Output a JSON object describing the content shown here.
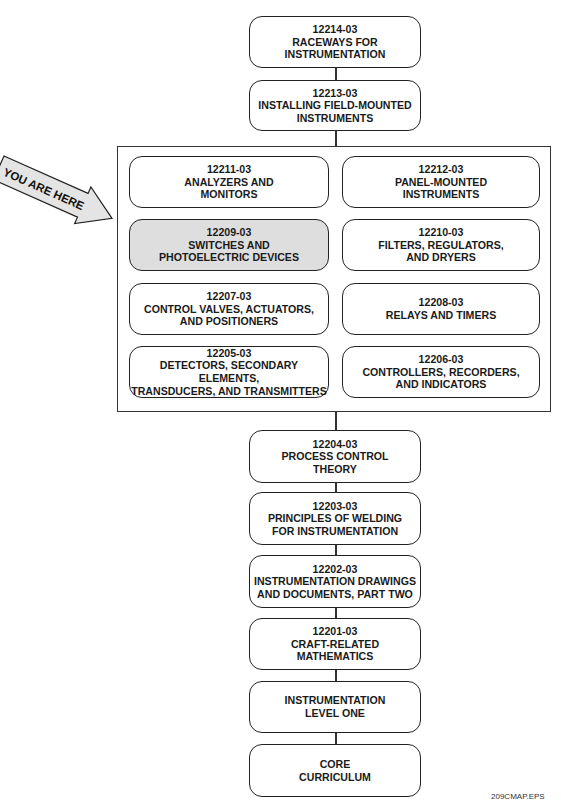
{
  "diagram": {
    "type": "course-map-flow",
    "pointer": {
      "label": "YOU ARE HERE",
      "points_to": "12209-03"
    },
    "top_stack": [
      {
        "code": "12214-03",
        "lines": [
          "RACEWAYS FOR",
          "INSTRUMENTATION"
        ]
      },
      {
        "code": "12213-03",
        "lines": [
          "INSTALLING FIELD-MOUNTED",
          "INSTRUMENTS"
        ]
      }
    ],
    "group": [
      {
        "code": "12211-03",
        "lines": [
          "ANALYZERS AND",
          "MONITORS"
        ]
      },
      {
        "code": "12212-03",
        "lines": [
          "PANEL-MOUNTED",
          "INSTRUMENTS"
        ]
      },
      {
        "code": "12209-03",
        "lines": [
          "SWITCHES AND",
          "PHOTOELECTRIC DEVICES"
        ],
        "current": true
      },
      {
        "code": "12210-03",
        "lines": [
          "FILTERS, REGULATORS,",
          "AND DRYERS"
        ]
      },
      {
        "code": "12207-03",
        "lines": [
          "CONTROL VALVES, ACTUATORS,",
          "AND POSITIONERS"
        ]
      },
      {
        "code": "12208-03",
        "lines": [
          "RELAYS AND TIMERS",
          ""
        ]
      },
      {
        "code": "12205-03",
        "lines": [
          "DETECTORS, SECONDARY ELEMENTS,",
          "TRANSDUCERS, AND TRANSMITTERS"
        ]
      },
      {
        "code": "12206-03",
        "lines": [
          "CONTROLLERS, RECORDERS,",
          "AND INDICATORS"
        ]
      }
    ],
    "bottom_stack": [
      {
        "code": "12204-03",
        "lines": [
          "PROCESS CONTROL",
          "THEORY"
        ]
      },
      {
        "code": "12203-03",
        "lines": [
          "PRINCIPLES OF WELDING",
          "FOR INSTRUMENTATION"
        ]
      },
      {
        "code": "12202-03",
        "lines": [
          "INSTRUMENTATION DRAWINGS",
          "AND DOCUMENTS, PART TWO"
        ]
      },
      {
        "code": "12201-03",
        "lines": [
          "CRAFT-RELATED",
          "MATHEMATICS"
        ]
      },
      {
        "code": "",
        "lines": [
          "INSTRUMENTATION",
          "LEVEL ONE"
        ]
      },
      {
        "code": "",
        "lines": [
          "CORE",
          "CURRICULUM"
        ]
      }
    ],
    "caption": "209CMAP.EPS",
    "colors": {
      "highlight_fill": "#dedede",
      "stroke": "#222222",
      "background": "#ffffff"
    }
  }
}
